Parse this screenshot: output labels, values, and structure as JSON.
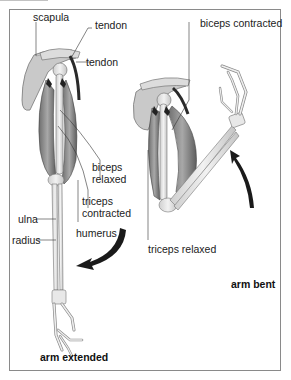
{
  "diagram": {
    "colors": {
      "border": "#8a8a8a",
      "bone": "#e6e6e6",
      "bone_outline": "#777777",
      "muscle": "#8e8e8e",
      "muscle_dark": "#555555",
      "tendon": "#2a2a2a",
      "arrow": "#1a1a1a",
      "label_text": "#222222"
    },
    "panels": [
      {
        "id": "extended",
        "caption": "arm extended",
        "labels": [
          {
            "text": "scapula"
          },
          {
            "text": "tendon"
          },
          {
            "text": "tendon"
          },
          {
            "text": "biceps"
          },
          {
            "text": "relaxed"
          },
          {
            "text": "triceps"
          },
          {
            "text": "contracted"
          },
          {
            "text": "ulna"
          },
          {
            "text": "radius"
          },
          {
            "text": "humerus"
          }
        ],
        "arrow": "curved-down-left-arrow"
      },
      {
        "id": "bent",
        "caption": "arm bent",
        "labels": [
          {
            "text": "biceps contracted"
          },
          {
            "text": "triceps relaxed"
          }
        ],
        "arrow": "curved-up-arrow"
      }
    ]
  }
}
